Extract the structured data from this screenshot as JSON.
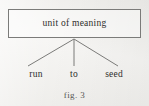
{
  "figure": {
    "caption": "fig. 3",
    "background_color": "#f2f1ee",
    "ink_color": "#2e2e2c",
    "line_color": "#7b7b79"
  },
  "diagram": {
    "type": "tree",
    "root": {
      "label": "unit of meaning",
      "shape": "rectangle"
    },
    "leaves": [
      {
        "label": "run"
      },
      {
        "label": "to"
      },
      {
        "label": "seed"
      }
    ]
  }
}
